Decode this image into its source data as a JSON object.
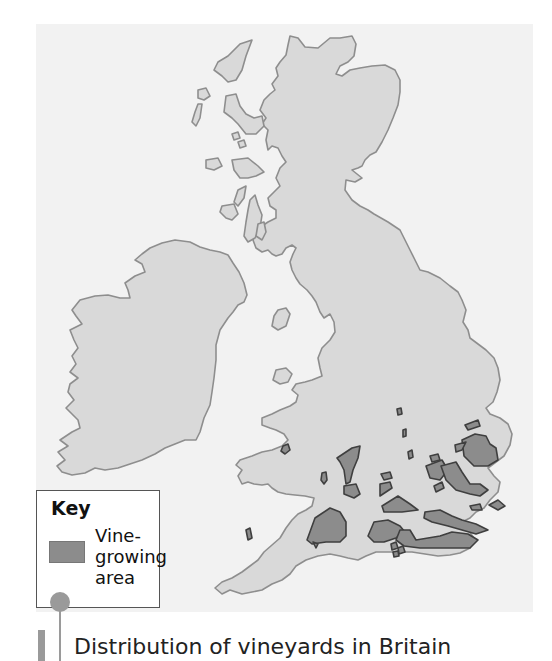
{
  "map": {
    "title": "Distribution of vineyards in Britain",
    "colors": {
      "background": "#ffffff",
      "sea": "#f2f2f2",
      "land": "#d9d9d9",
      "land_outline": "#8e8e8e",
      "vineyard": "#8c8c8c",
      "vineyard_outline": "#3f3f3f"
    },
    "regions": [
      "Ireland",
      "Scotland",
      "England",
      "Wales",
      "Isle of Man",
      "Western Isles",
      "Orkney-like islands"
    ],
    "vineyard_areas": "Scattered across southern and eastern England and south Wales"
  },
  "key": {
    "title": "Key",
    "items": [
      {
        "label": "Vine-growing area",
        "lines": [
          "Vine-",
          "growing",
          "area"
        ],
        "color": "#8c8c8c"
      }
    ]
  },
  "caption": {
    "text": "Distribution of vineyards in Britain"
  }
}
